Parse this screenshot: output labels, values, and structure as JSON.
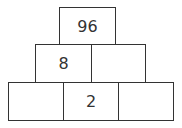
{
  "pyramid": {
    "rows": [
      {
        "cells": [
          {
            "value": "96"
          }
        ]
      },
      {
        "cells": [
          {
            "value": "8"
          },
          {
            "value": ""
          }
        ]
      },
      {
        "cells": [
          {
            "value": ""
          },
          {
            "value": "2"
          },
          {
            "value": ""
          }
        ]
      }
    ]
  }
}
